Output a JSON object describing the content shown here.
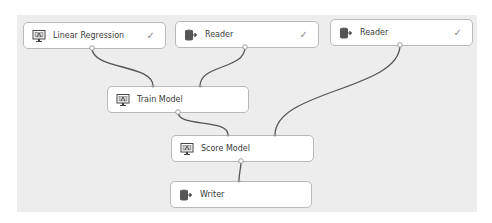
{
  "nodes": [
    {
      "id": "linear-regression",
      "label": "Linear Regression",
      "icon": "model-monitor-icon",
      "status": "✓"
    },
    {
      "id": "reader-1",
      "label": "Reader",
      "icon": "database-export-icon",
      "status": "✓"
    },
    {
      "id": "reader-2",
      "label": "Reader",
      "icon": "database-export-icon",
      "status": "✓"
    },
    {
      "id": "train-model",
      "label": "Train Model",
      "icon": "model-monitor-icon",
      "status": ""
    },
    {
      "id": "score-model",
      "label": "Score Model",
      "icon": "model-monitor-icon",
      "status": ""
    },
    {
      "id": "writer",
      "label": "Writer",
      "icon": "database-export-icon",
      "status": ""
    }
  ],
  "edges": [
    {
      "from": "linear-regression",
      "to": "train-model"
    },
    {
      "from": "reader-1",
      "to": "train-model"
    },
    {
      "from": "train-model",
      "to": "score-model"
    },
    {
      "from": "reader-2",
      "to": "score-model"
    },
    {
      "from": "score-model",
      "to": "writer"
    }
  ],
  "colors": {
    "canvas": "#ededed",
    "node_border": "#b9b9b9",
    "wire": "#555555"
  }
}
